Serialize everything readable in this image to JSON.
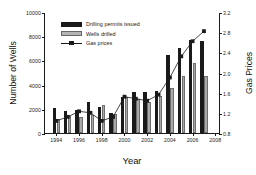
{
  "chart_data": {
    "type": "bar",
    "title": "",
    "xlabel": "Year",
    "ylabel": "Number of Wells",
    "y2label": "Gas Prices",
    "categories": [
      1994,
      1995,
      1996,
      1997,
      1998,
      1999,
      2000,
      2001,
      2002,
      2003,
      2004,
      2005,
      2006,
      2007
    ],
    "xlim": [
      1993,
      2008.5
    ],
    "xticks": [
      1994,
      1996,
      1998,
      2000,
      2002,
      2004,
      2006,
      2008
    ],
    "xticklabels": [
      "1994",
      "1996",
      "1998",
      "2000",
      "2002",
      "2004",
      "2006",
      "2008"
    ],
    "ylim": [
      0,
      10000
    ],
    "yticks": [
      0,
      2000,
      4000,
      6000,
      8000,
      10000
    ],
    "yticklabels": [
      "0",
      "2000",
      "4000",
      "6000",
      "8000",
      "10000"
    ],
    "y2lim": [
      0.8,
      3.2
    ],
    "y2ticks": [
      0.8,
      1.2,
      1.6,
      2.0,
      2.4,
      2.8,
      3.2
    ],
    "y2ticklabels": [
      "0.8",
      "1.2",
      "1.6",
      "2.0",
      "2.4",
      "2.8",
      "3.2"
    ],
    "grid": false,
    "legend_position": "upper left",
    "series": [
      {
        "name": "Drilling permits issued",
        "type": "bar",
        "axis": "left",
        "color": "#1a1a1a",
        "values": [
          2080,
          1800,
          1900,
          2540,
          2180,
          1640,
          3000,
          3420,
          3420,
          3500,
          6480,
          7040,
          7700,
          7620
        ]
      },
      {
        "name": "Wells drilled",
        "type": "bar",
        "axis": "left",
        "color": "#a8a8a8",
        "values": [
          1160,
          1420,
          1340,
          1520,
          2280,
          1560,
          2940,
          2820,
          2580,
          3020,
          3760,
          4700,
          5820,
          4720
        ]
      },
      {
        "name": "Gas prices",
        "type": "line",
        "axis": "right",
        "color": "#1a1a1a",
        "marker": "square",
        "values": [
          1.06,
          1.14,
          1.25,
          1.22,
          1.06,
          1.14,
          1.54,
          1.5,
          1.46,
          1.58,
          1.92,
          2.34,
          2.64,
          2.84
        ]
      }
    ]
  },
  "legend": {
    "items": [
      {
        "label": "Drilling permits issued",
        "key": "permits"
      },
      {
        "label": "Wells drilled",
        "key": "wells"
      },
      {
        "label": "Gas prices",
        "key": "line"
      }
    ]
  }
}
